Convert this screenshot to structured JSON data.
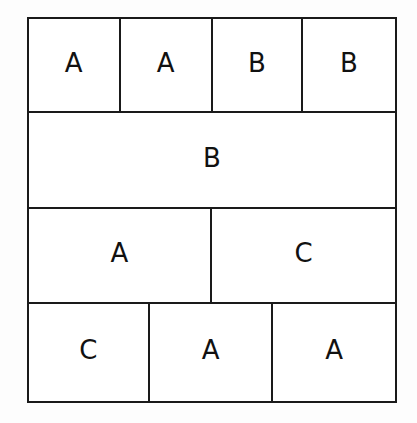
{
  "figure": {
    "type": "block-layout-grid",
    "background_color": "#fdfdfd",
    "cell_background_color": "#ffffff",
    "line_color": "#1a1a1a",
    "text_color": "#111111"
  },
  "grid": {
    "rows": [
      {
        "row_index": 1,
        "height_ratio": 24.6,
        "cells": [
          {
            "label": "A",
            "width_ratio": 25.0
          },
          {
            "label": "A",
            "width_ratio": 25.2
          },
          {
            "label": "B",
            "width_ratio": 24.7
          },
          {
            "label": "B",
            "width_ratio": 25.1
          }
        ]
      },
      {
        "row_index": 2,
        "height_ratio": 25.1,
        "cells": [
          {
            "label": "B",
            "width_ratio": 100.0
          }
        ]
      },
      {
        "row_index": 3,
        "height_ratio": 24.9,
        "cells": [
          {
            "label": "A",
            "width_ratio": 50.0
          },
          {
            "label": "C",
            "width_ratio": 50.0
          }
        ]
      },
      {
        "row_index": 4,
        "height_ratio": 25.4,
        "cells": [
          {
            "label": "C",
            "width_ratio": 33.0
          },
          {
            "label": "A",
            "width_ratio": 33.8
          },
          {
            "label": "A",
            "width_ratio": 33.2
          }
        ]
      }
    ]
  }
}
